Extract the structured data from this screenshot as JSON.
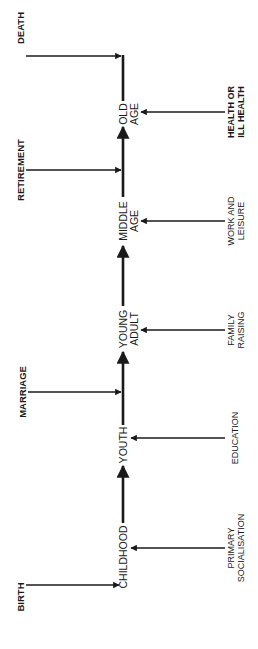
{
  "diagram": {
    "title": "",
    "orientation": "rotated-90-ccw",
    "stages": [
      {
        "id": "childhood",
        "lines": [
          "CHILDHOOD"
        ]
      },
      {
        "id": "youth",
        "lines": [
          "YOUTH"
        ]
      },
      {
        "id": "young-adult",
        "lines": [
          "YOUNG",
          "ADULT"
        ]
      },
      {
        "id": "middle-age",
        "lines": [
          "MIDDLE",
          "AGE"
        ]
      },
      {
        "id": "old-age",
        "lines": [
          "OLD",
          "AGE"
        ]
      }
    ],
    "events": [
      {
        "id": "birth",
        "label": "BIRTH",
        "target": "childhood"
      },
      {
        "id": "marriage",
        "label": "MARRIAGE",
        "target": "youth-to-young-adult"
      },
      {
        "id": "retirement",
        "label": "RETIREMENT",
        "target": "middle-age-to-old-age"
      },
      {
        "id": "death",
        "label": "DEATH",
        "target": "end-of-old-age"
      }
    ],
    "influences": [
      {
        "id": "primary-socialisation",
        "lines": [
          "PRIMARY",
          "SOCIALISATION"
        ],
        "target": "childhood"
      },
      {
        "id": "education",
        "lines": [
          "EDUCATION"
        ],
        "target": "youth"
      },
      {
        "id": "family-raising",
        "lines": [
          "FAMILY",
          "RAISING"
        ],
        "target": "young-adult"
      },
      {
        "id": "work-and-leisure",
        "lines": [
          "WORK AND",
          "LEISURE"
        ],
        "target": "middle-age"
      },
      {
        "id": "health-or-ill-health",
        "lines": [
          "HEALTH OR",
          "ILL HEALTH"
        ],
        "target": "old-age"
      }
    ],
    "colors": {
      "line": "#1a1a1a",
      "background": "#ffffff"
    }
  }
}
